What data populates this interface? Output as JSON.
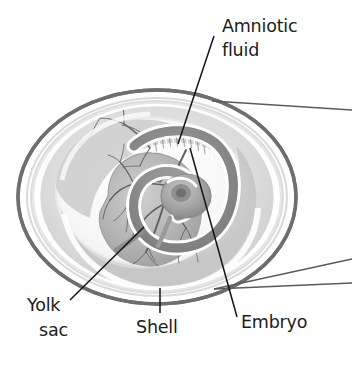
{
  "figure": {
    "name": "egg-cross-section-diagram",
    "style": "grayscale pencil-shaded scientific illustration",
    "background_color": "#ffffff"
  },
  "labels": {
    "amniotic_fluid": {
      "line1": "Amniotic",
      "line2": "fluid"
    },
    "yolk_sac": {
      "line1": "Yolk",
      "line2": "sac"
    },
    "shell": {
      "line1": "Shell"
    },
    "embryo": {
      "line1": "Embryo"
    }
  },
  "colors": {
    "text": "#1b1b1b",
    "shell_outline": "#6e6e6e",
    "leader_line": "#141414",
    "callout_line": "#5a5a5a",
    "membrane_light": "#e2e2e2",
    "membrane_mid": "#cfcfcf",
    "albumen_white": "#ffffff",
    "yolk_fill": "#b9b9b9",
    "embryo_dark": "#8a8a8a",
    "vessel": "#5f5f5f"
  },
  "structures": [
    {
      "id": "shell",
      "label": "Shell"
    },
    {
      "id": "shell-membrane",
      "label": "Shell membrane"
    },
    {
      "id": "albumen",
      "label": "Albumen"
    },
    {
      "id": "amnion",
      "label": "Amniotic fluid"
    },
    {
      "id": "embryo",
      "label": "Embryo"
    },
    {
      "id": "yolk-sac",
      "label": "Yolk sac"
    },
    {
      "id": "vitelline-vessels",
      "label": "Yolk sac blood vessels"
    }
  ]
}
